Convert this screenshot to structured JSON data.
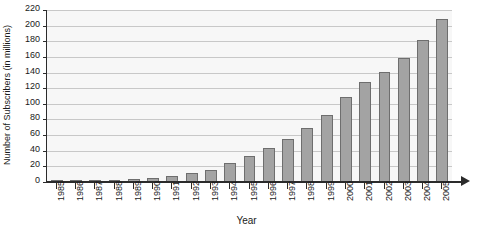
{
  "chart_data": {
    "type": "bar",
    "title": "",
    "xlabel": "Year",
    "ylabel": "Number of Subscribers (in millions)",
    "ylim": [
      0,
      220
    ],
    "ytick_step": 20,
    "yticks": [
      0,
      20,
      40,
      60,
      80,
      100,
      120,
      140,
      160,
      180,
      200,
      220
    ],
    "grid": true,
    "legend": "none",
    "bar_color": "#a3a3a3",
    "bar_border_color": "#6e6e6e",
    "plot_background": "#f7f7f7",
    "axis_color": "#2b2b2b",
    "gridline_color": "#c8c8c8",
    "categories": [
      "1985",
      "1986",
      "1987",
      "1988",
      "1989",
      "1990",
      "1991",
      "1992",
      "1993",
      "1994",
      "1995",
      "1996",
      "1997",
      "1998",
      "1999",
      "2000",
      "2001",
      "2002",
      "2003",
      "2004",
      "2005"
    ],
    "values": [
      0.3,
      0.7,
      1.2,
      2.1,
      3.5,
      5.3,
      7.6,
      11,
      16,
      24,
      33,
      44,
      55,
      69,
      86,
      109,
      128,
      141,
      159,
      182,
      208
    ]
  }
}
